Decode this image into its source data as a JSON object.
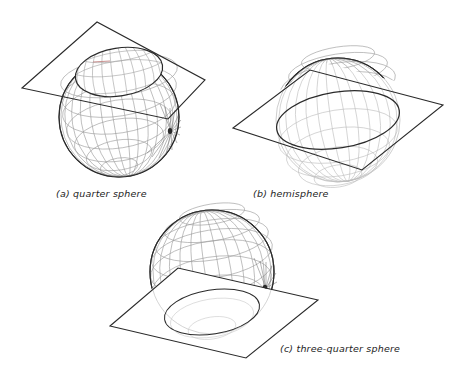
{
  "figure": {
    "background_color": "#ffffff",
    "ink_color": "#1d1d1d",
    "mesh_color": "#9a9a9a",
    "mesh_color_light": "#bdbdbd",
    "panels": [
      {
        "id": "a",
        "caption": "(a) quarter sphere",
        "shape": "sphere",
        "cut": "plane above equator, quarter sphere removed",
        "sphere_center_x": 119,
        "sphere_center_y": 117,
        "sphere_radius": 60,
        "plane_points": "22,88 97,22 205,80 168,119",
        "cut_ellipse_cx": 119,
        "cut_ellipse_cy": 72,
        "cut_ellipse_rx": 44,
        "cut_ellipse_ry": 24,
        "cut_ellipse_rotation": -9
      },
      {
        "id": "b",
        "caption": "(b) hemisphere",
        "shape": "sphere",
        "cut": "plane through equator, hemisphere above",
        "sphere_center_x": 338,
        "sphere_center_y": 120,
        "sphere_radius": 62,
        "plane_points": "233,128 310,70 443,105 362,170",
        "cut_ellipse_cx": 338,
        "cut_ellipse_cy": 120,
        "cut_ellipse_rx": 62,
        "cut_ellipse_ry": 28,
        "cut_ellipse_rotation": -9
      },
      {
        "id": "c",
        "caption": "(c) three-quarter sphere",
        "shape": "sphere",
        "cut": "plane below equator, three-quarter sphere above",
        "sphere_center_x": 212,
        "sphere_center_y": 272,
        "sphere_radius": 62,
        "plane_points": "110,326 178,268 318,300 246,358",
        "cut_ellipse_cx": 212,
        "cut_ellipse_cy": 312,
        "cut_ellipse_rx": 48,
        "cut_ellipse_ry": 22,
        "cut_ellipse_rotation": -9
      }
    ]
  }
}
